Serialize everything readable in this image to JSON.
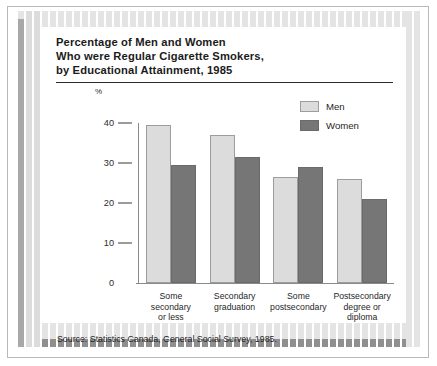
{
  "figure": {
    "title_lines": [
      "Percentage of Men and Women",
      "Who were Regular Cigarette Smokers,",
      "by Educational Attainment, 1985"
    ],
    "unit_label": "%",
    "source": "Source: Statistics Canada, General Social Survey, 1985."
  },
  "colors": {
    "men": "#dcdcdc",
    "women": "#767676",
    "men_border": "#9d9d9d",
    "women_border": "#6a6a6a",
    "axis": "#8a8a8a",
    "text": "#1f1f1f",
    "rule": "#2b2b2b",
    "deco_light": "#e4e4e4",
    "deco_dark": "#8f8f8f",
    "page_background": "#ffffff"
  },
  "legend": {
    "position": "top-right",
    "entries": [
      {
        "label": "Men",
        "swatch": "men"
      },
      {
        "label": "Women",
        "swatch": "women"
      }
    ]
  },
  "chart_data": {
    "type": "bar",
    "title": "Percentage of Men and Women Who were Regular Cigarette Smokers, by Educational Attainment, 1985",
    "xlabel": "",
    "ylabel": "%",
    "ylim": [
      0,
      40
    ],
    "yticks": [
      0,
      10,
      20,
      30,
      40
    ],
    "ytick_labels": [
      "0",
      "10",
      "20",
      "30",
      "40"
    ],
    "grid": false,
    "legend_position": "top-right",
    "categories": [
      "Some secondary or less",
      "Secondary graduation",
      "Some postsecondary",
      "Postsecondary degree or diploma"
    ],
    "category_label_lines": [
      [
        "Some",
        "secondary",
        "or less"
      ],
      [
        "Secondary",
        "graduation"
      ],
      [
        "Some",
        "postsecondary"
      ],
      [
        "Postsecondary",
        "degree or",
        "diploma"
      ]
    ],
    "series": [
      {
        "name": "Men",
        "values": [
          39.4,
          37.0,
          26.5,
          26.0
        ]
      },
      {
        "name": "Women",
        "values": [
          29.4,
          31.5,
          29.0,
          21.0
        ]
      }
    ],
    "source": "Source: Statistics Canada, General Social Survey, 1985."
  }
}
